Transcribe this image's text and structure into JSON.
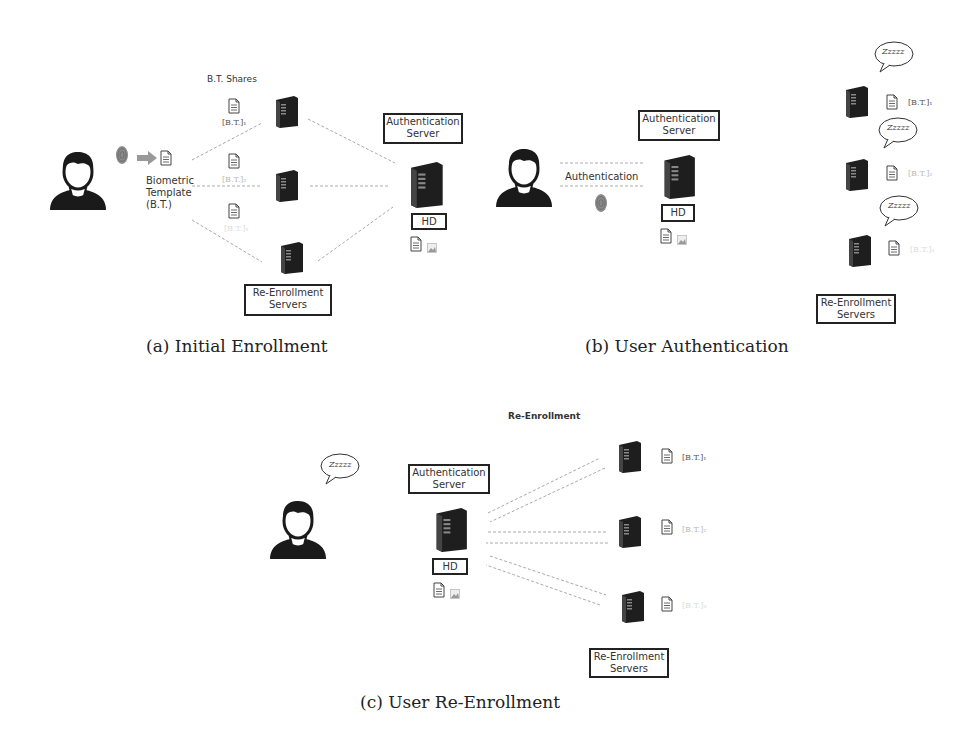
{
  "panel_a": {
    "shares_title": "B.T. Shares",
    "template_label_1": "Biometric",
    "template_label_2": "Template",
    "template_label_3": "(B.T.)",
    "share_1": "[B.T.]₁",
    "share_2": "[B.T.]₂",
    "share_3": "[B.T.]₃",
    "auth_server_1": "Authentication",
    "auth_server_2": "Server",
    "hd": "HD",
    "reenroll_1": "Re-Enrollment",
    "reenroll_2": "Servers",
    "caption": "(a) Initial Enrollment"
  },
  "panel_b": {
    "auth_server_1": "Authentication",
    "auth_server_2": "Server",
    "link_label": "Authentication",
    "hd": "HD",
    "zzz": "Zzzzz",
    "share_1": "[B.T.]₁",
    "share_2": "[B.T.]₂",
    "share_3": "[B.T.]₃",
    "reenroll_1": "Re-Enrollment",
    "reenroll_2": "Servers",
    "caption": "(b) User Authentication"
  },
  "panel_c": {
    "title": "Re-Enrollment",
    "zzz": "Zzzzz",
    "auth_server_1": "Authentication",
    "auth_server_2": "Server",
    "hd": "HD",
    "share_1": "[B.T.]₁",
    "share_2": "[B.T.]₂",
    "share_3": "[B.T.]₃",
    "reenroll_1": "Re-Enrollment",
    "reenroll_2": "Servers",
    "caption": "(c) User Re-Enrollment"
  },
  "icons": {
    "user": "person-silhouette",
    "server": "server-tower",
    "document": "document",
    "fingerprint": "fingerprint",
    "image": "image-thumbnail",
    "speech": "speech-bubble",
    "arrow": "block-arrow"
  },
  "colors": {
    "line": "#999999",
    "server": "#2a2a2a",
    "text": "#333333"
  }
}
